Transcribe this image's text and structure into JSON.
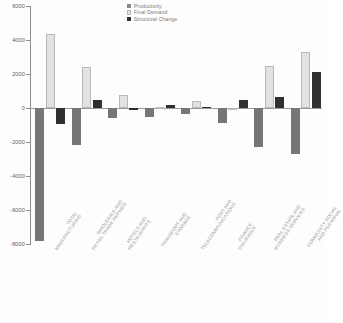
{
  "chart_data": {
    "type": "bar",
    "title": "",
    "subtitle": "",
    "xlabel": "",
    "ylabel": "",
    "ylim": [
      -8000,
      6000
    ],
    "ytick_step": 2000,
    "yticks": [
      6000,
      4000,
      2000,
      0,
      -2000,
      -4000,
      -6000,
      -8000
    ],
    "ytick_labels": [
      "6000",
      "4000",
      "2000",
      "0",
      "-2000",
      "-4000",
      "-6000",
      "-8000"
    ],
    "grid": false,
    "legend_position": "top-center",
    "categories": [
      "TOTAL MANUFACTURING",
      "WHOLESALE AND RETAIL TRADE REPAIRS",
      "HOTELS AND RESTAURANTS",
      "TRANSPORT AND STORAGE",
      "POST AND TELECOMMUNICATIONS",
      "FINANCE INSURANCE",
      "REAL ESTATE AND BUSINESS SERVICES",
      "COMMUNITY SOCIAL AND PERSONAL"
    ],
    "category_lines": [
      [
        "TOTAL",
        "MANUFACTURING"
      ],
      [
        "WHOLESALE AND",
        "RETAIL TRADE REPAIRS"
      ],
      [
        "HOTELS AND",
        "RESTAURANTS"
      ],
      [
        "TRANSPORT AND",
        "STORAGE"
      ],
      [
        "POST AND",
        "TELECOMMUNICATIONS"
      ],
      [
        "FINANCE",
        "INSURANCE"
      ],
      [
        "REAL ESTATE AND",
        "BUSINESS SERVICES"
      ],
      [
        "COMMUNITY SOCIAL",
        "AND PERSONAL"
      ]
    ],
    "series": [
      {
        "name": "Productivity",
        "color": "#767676",
        "values": [
          -7800,
          -2150,
          -600,
          -550,
          -350,
          -900,
          -2300,
          -2700
        ]
      },
      {
        "name": "Final Demand",
        "color": "#e2e2e2",
        "values": [
          4350,
          2400,
          750,
          50,
          400,
          0,
          2500,
          3300
        ]
      },
      {
        "name": "Structural Change",
        "color": "#2f2f2f",
        "values": [
          -950,
          500,
          -100,
          200,
          50,
          500,
          650,
          2100
        ]
      }
    ]
  }
}
